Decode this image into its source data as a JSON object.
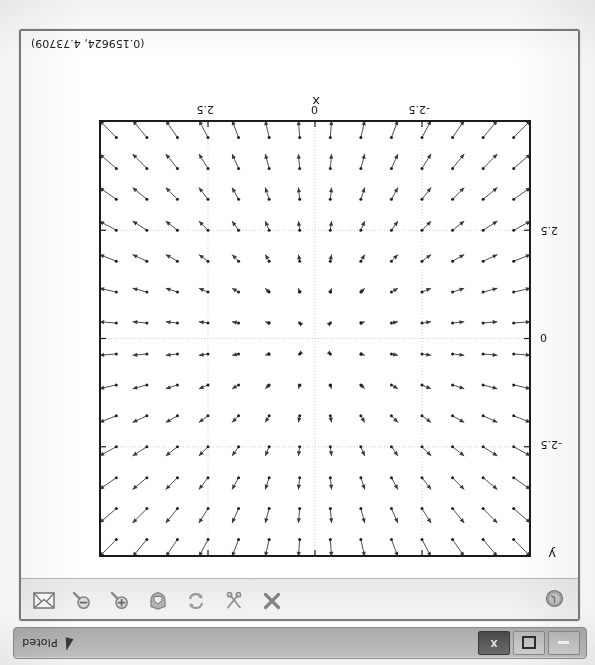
{
  "window": {
    "frame_border_color": "#7d7d7b",
    "background": "#fbfbfb"
  },
  "taskbar": {
    "app_name": "Ploted",
    "pen_icon": "pen-icon",
    "buttons": [
      {
        "name": "minimize-button",
        "glyph": "minimize"
      },
      {
        "name": "maximize-button",
        "glyph": "maximize"
      },
      {
        "name": "close-window-button",
        "glyph": "x",
        "label": "X",
        "active": true
      }
    ]
  },
  "toolbar": {
    "left_tools": [
      {
        "name": "about-icon",
        "icon": "info-circle-icon",
        "label": "About"
      }
    ],
    "right_tools": [
      {
        "name": "close-icon",
        "icon": "close-x-icon",
        "label": "Close"
      },
      {
        "name": "cut-icon",
        "icon": "scissors-icon",
        "label": "Cut"
      },
      {
        "name": "refresh-icon",
        "icon": "refresh-arrows-icon",
        "label": "Refresh"
      },
      {
        "name": "home-icon",
        "icon": "home-shield-icon",
        "label": "Home"
      },
      {
        "name": "zoom-in-icon",
        "icon": "magnifier-plus-icon",
        "label": "Zoom In"
      },
      {
        "name": "zoom-out-icon",
        "icon": "magnifier-minus-icon",
        "label": "Zoom Out"
      },
      {
        "name": "save-icon",
        "icon": "envelope-icon",
        "label": "Save"
      }
    ]
  },
  "plot": {
    "coordinate_readout": "(0.159624, 4.73709)",
    "x_axis_label": "x",
    "y_axis_label": "y",
    "x_ticks": [
      "-2.5",
      "0",
      "2.5"
    ],
    "y_ticks": [
      "-2.5",
      "0",
      "2.5"
    ],
    "axis_color": "#1b1b1b",
    "arrow_color": "#3a3a3a",
    "grid_color": "#cfcfcf"
  },
  "chart_data": {
    "type": "scatter",
    "plot_kind": "quiver-vector-field",
    "title": "",
    "xlabel": "x",
    "ylabel": "y",
    "xlim": [
      -5,
      5
    ],
    "ylim": [
      -5,
      5
    ],
    "xticks": [
      -2.5,
      0,
      2.5
    ],
    "yticks": [
      -2.5,
      0,
      2.5
    ],
    "xticklabels": [
      "-2.5",
      "0",
      "2.5"
    ],
    "yticklabels": [
      "-2.5",
      "0",
      "2.5"
    ],
    "grid": true,
    "legend": null,
    "grid_n": 14,
    "grid_start": -4.642857,
    "grid_step": 0.714286,
    "field_formula": "u = x, v = y (radial outward)",
    "vector_scale": 0.085,
    "annotations": [
      "(0.159624, 4.73709)"
    ]
  }
}
